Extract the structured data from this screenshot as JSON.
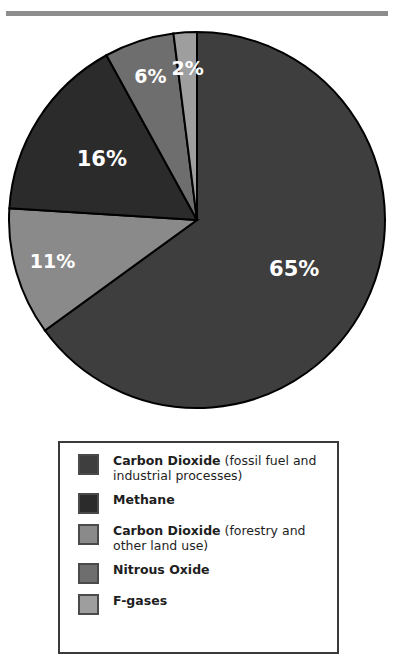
{
  "chart_data": {
    "type": "pie",
    "title": "",
    "categories": [
      "Carbon Dioxide (fossil fuel and industrial processes)",
      "Carbon Dioxide (forestry and other land use)",
      "Methane",
      "Nitrous Oxide",
      "F-gases"
    ],
    "values": [
      65,
      11,
      16,
      6,
      2
    ],
    "labels": [
      "65%",
      "11%",
      "16%",
      "6%",
      "2%"
    ],
    "colors": [
      "#3e3e3e",
      "#8a8a8a",
      "#2b2b2b",
      "#6e6e6e",
      "#9e9e9e"
    ],
    "start_angle_deg": 0,
    "direction": "clockwise",
    "label_color": "#ffffff",
    "separator_color": "#000000",
    "legend_position": "bottom"
  },
  "top_rule": {
    "color": "#8d8d8d"
  },
  "pie": {
    "slices": [
      {
        "name": "carbon-dioxide-fossil",
        "label": "65%",
        "value": 65,
        "color": "#3e3e3e"
      },
      {
        "name": "carbon-dioxide-forestry",
        "label": "11%",
        "value": 11,
        "color": "#8a8a8a"
      },
      {
        "name": "methane",
        "label": "16%",
        "value": 16,
        "color": "#2b2b2b"
      },
      {
        "name": "nitrous-oxide",
        "label": "6%",
        "value": 6,
        "color": "#6e6e6e"
      },
      {
        "name": "f-gases",
        "label": "2%",
        "value": 2,
        "color": "#9e9e9e"
      }
    ]
  },
  "legend": {
    "border_color": "#3a3a3a",
    "items": [
      {
        "name": "Carbon Dioxide",
        "qualifier": " (fossil fuel and industrial processes)",
        "color": "#3e3e3e"
      },
      {
        "name": "Methane",
        "qualifier": "",
        "color": "#2b2b2b"
      },
      {
        "name": "Carbon Dioxide",
        "qualifier": " (forestry and other land use)",
        "color": "#8a8a8a"
      },
      {
        "name": "Nitrous Oxide",
        "qualifier": "",
        "color": "#6e6e6e"
      },
      {
        "name": "F-gases",
        "qualifier": "",
        "color": "#9e9e9e"
      }
    ]
  }
}
